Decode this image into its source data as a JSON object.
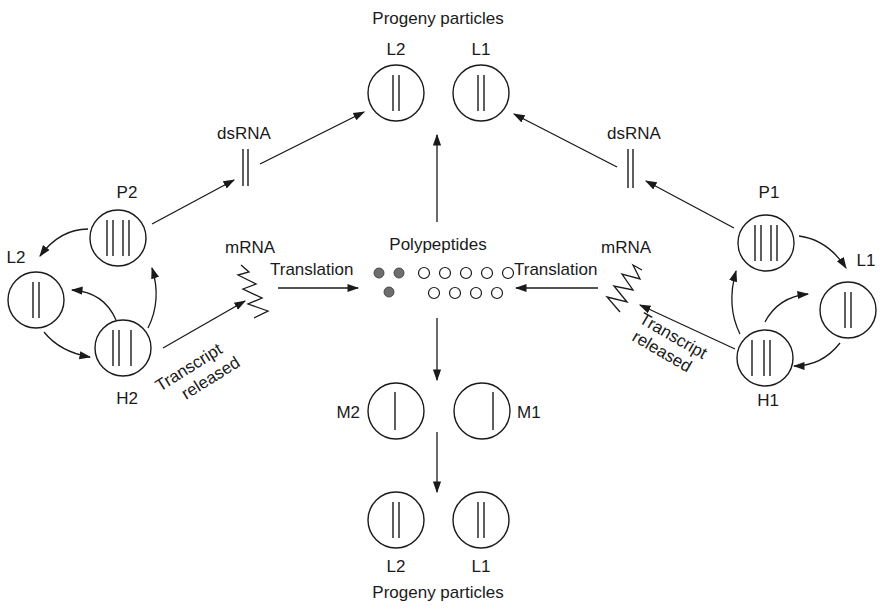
{
  "diagram": {
    "labels": {
      "top_title": "Progeny particles",
      "bottom_title": "Progeny particles",
      "polypeptides": "Polypeptides",
      "dsrna_left": "dsRNA",
      "dsrna_right": "dsRNA",
      "mrna_left": "mRNA",
      "mrna_right": "mRNA",
      "translation_left": "Translation",
      "translation_right": "Translation",
      "transcript_left_1": "Transcript",
      "transcript_left_2": "released",
      "transcript_right_1": "Transcript",
      "transcript_right_2": "released"
    },
    "particles": {
      "top_l2": "L2",
      "top_l1": "L1",
      "p2": "P2",
      "l2_left": "L2",
      "h2": "H2",
      "p1": "P1",
      "l1_right": "L1",
      "h1": "H1",
      "m2": "M2",
      "m1": "M1",
      "bottom_l2": "L2",
      "bottom_l1": "L1"
    },
    "polypeptide_dots": {
      "filled_count": 3,
      "open_top_count": 5,
      "open_bottom_count": 4,
      "filled_color": "#6e6e6e"
    }
  }
}
